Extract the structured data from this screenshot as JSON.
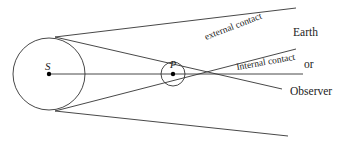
{
  "diagram": {
    "labels": {
      "sun": "S",
      "planet": "P",
      "external": "external contact",
      "internal": "Internal contact",
      "earth": "Earth",
      "or": "or",
      "observer": "Observer"
    },
    "sun": {
      "cx": 49,
      "cy": 74,
      "r": 36
    },
    "planet": {
      "cx": 173,
      "cy": 74,
      "r": 12
    },
    "line_color": "#333333"
  }
}
